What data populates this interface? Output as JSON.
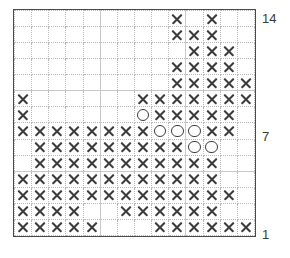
{
  "chart": {
    "type": "knitting-chart-grid",
    "columns": 14,
    "rows": 14,
    "symbols": {
      "x": "cross-stitch",
      "o": "open-circle",
      "blank": "empty"
    },
    "colors": {
      "frame": "#4a4a4a",
      "gridline": "#b9b9b9",
      "symbol": "#3c3c3c",
      "background": "#ffffff",
      "label": "#3a3a3a"
    },
    "row_labels": [
      {
        "number": "14",
        "row_index": 14
      },
      {
        "number": "7",
        "row_index": 7
      },
      {
        "number": "1",
        "row_index": 1
      }
    ],
    "grid": [
      [
        "",
        "",
        "",
        "",
        "",
        "",
        "",
        "",
        "",
        "x",
        "",
        "x",
        "",
        ""
      ],
      [
        "",
        "",
        "",
        "",
        "",
        "",
        "",
        "",
        "",
        "x",
        "x",
        "x",
        "",
        ""
      ],
      [
        "",
        "",
        "",
        "",
        "",
        "",
        "",
        "",
        "",
        "",
        "x",
        "x",
        "x",
        ""
      ],
      [
        "",
        "",
        "",
        "",
        "",
        "",
        "",
        "",
        "",
        "x",
        "x",
        "x",
        "x",
        ""
      ],
      [
        "",
        "",
        "",
        "",
        "",
        "",
        "",
        "",
        "",
        "x",
        "x",
        "x",
        "x",
        "x"
      ],
      [
        "x",
        "",
        "",
        "",
        "",
        "",
        "",
        "x",
        "x",
        "x",
        "x",
        "x",
        "x",
        "x"
      ],
      [
        "x",
        "",
        "",
        "",
        "",
        "",
        "",
        "o",
        "x",
        "x",
        "x",
        "x",
        "x",
        ""
      ],
      [
        "x",
        "x",
        "x",
        "x",
        "x",
        "x",
        "x",
        "x",
        "o",
        "o",
        "o",
        "x",
        "x",
        ""
      ],
      [
        "",
        "x",
        "x",
        "x",
        "x",
        "x",
        "x",
        "x",
        "x",
        "x",
        "o",
        "o",
        "",
        ""
      ],
      [
        "",
        "x",
        "x",
        "x",
        "x",
        "x",
        "x",
        "x",
        "x",
        "x",
        "x",
        "x",
        "",
        ""
      ],
      [
        "x",
        "x",
        "x",
        "x",
        "x",
        "x",
        "x",
        "x",
        "x",
        "x",
        "x",
        "x",
        "",
        ""
      ],
      [
        "x",
        "x",
        "x",
        "x",
        "x",
        "x",
        "x",
        "x",
        "x",
        "x",
        "x",
        "x",
        "x",
        ""
      ],
      [
        "x",
        "x",
        "x",
        "x",
        "",
        "",
        "x",
        "x",
        "x",
        "x",
        "x",
        "x",
        "",
        ""
      ],
      [
        "x",
        "x",
        "x",
        "x",
        "x",
        "",
        "",
        "",
        "x",
        "x",
        "x",
        "x",
        "x",
        "x"
      ]
    ]
  }
}
